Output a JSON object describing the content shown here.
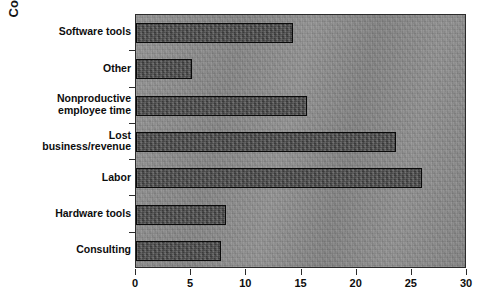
{
  "chart_data": {
    "type": "bar",
    "orientation": "horizontal",
    "title": "",
    "xlabel": "",
    "ylabel": "Cost",
    "xlim": [
      0,
      30
    ],
    "xticks": [
      0,
      5,
      10,
      15,
      20,
      25,
      30
    ],
    "xtick_labels": [
      "0",
      "5",
      "10",
      "15",
      "20",
      "25",
      "30"
    ],
    "grid": false,
    "legend": null,
    "categories": [
      "Software tools",
      "Other",
      "Nonproductive employee time",
      "Lost business/revenue",
      "Labor",
      "Hardware tools",
      "Consulting"
    ],
    "category_label_lines": [
      [
        "Software tools"
      ],
      [
        "Other"
      ],
      [
        "Nonproductive",
        "employee time"
      ],
      [
        "Lost",
        "business/revenue"
      ],
      [
        "Labor"
      ],
      [
        "Hardware tools"
      ],
      [
        "Consulting"
      ]
    ],
    "values": [
      14.2,
      5.1,
      15.5,
      23.6,
      25.9,
      8.2,
      7.7
    ],
    "colors": {
      "bar_fill": "#4d4d4d",
      "bar_border": "#0a0a0a",
      "plot_background": "#8c8c8c",
      "axis": "#2b2b2b",
      "text": "#0d0d0d",
      "figure_background": "#ffffff"
    }
  }
}
